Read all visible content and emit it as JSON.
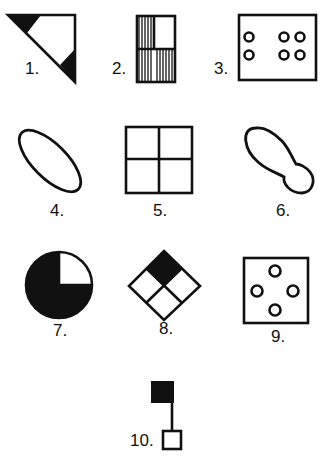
{
  "figure": {
    "items": [
      {
        "number": "1.",
        "shape": "right-triangle-with-black-corners"
      },
      {
        "number": "2.",
        "shape": "rectangle-three-hatched-quadrants"
      },
      {
        "number": "3.",
        "shape": "rectangle-with-six-circles"
      },
      {
        "number": "4.",
        "shape": "tilted-ellipse"
      },
      {
        "number": "5.",
        "shape": "square-divided-into-four"
      },
      {
        "number": "6.",
        "shape": "peanut-blob"
      },
      {
        "number": "7.",
        "shape": "circle-three-quarters-black"
      },
      {
        "number": "8.",
        "shape": "diamond-four-cells-top-black"
      },
      {
        "number": "9.",
        "shape": "square-with-four-circles"
      },
      {
        "number": "10.",
        "shape": "black-block-line-to-white-square"
      }
    ]
  },
  "colors": {
    "ink": "#111111",
    "paper": "#ffffff"
  }
}
